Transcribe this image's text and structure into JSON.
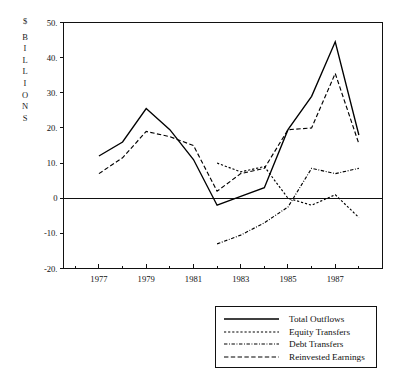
{
  "chart_data": {
    "type": "line",
    "title": "",
    "subtitle": "",
    "xlabel": "",
    "ylabel": "$ BILLIONS",
    "ylabel_chars": [
      "$",
      "B",
      "I",
      "L",
      "L",
      "I",
      "O",
      "N",
      "S"
    ],
    "xlim": [
      1975.5,
      1989.0
    ],
    "ylim": [
      -20,
      50
    ],
    "grid": false,
    "legend_position": "below-right",
    "y_ticks": [
      {
        "value": 50,
        "label": "50."
      },
      {
        "value": 40,
        "label": "40."
      },
      {
        "value": 30,
        "label": "30."
      },
      {
        "value": 20,
        "label": "20."
      },
      {
        "value": 10,
        "label": "10."
      },
      {
        "value": 0,
        "label": "0"
      },
      {
        "value": -10,
        "label": "-10."
      },
      {
        "value": -20,
        "label": "-20."
      }
    ],
    "x_ticks_major": [
      {
        "value": 1977,
        "label": "1977"
      },
      {
        "value": 1979,
        "label": "1979"
      },
      {
        "value": 1981,
        "label": "1981"
      },
      {
        "value": 1983,
        "label": "1983"
      },
      {
        "value": 1985,
        "label": "1985"
      },
      {
        "value": 1987,
        "label": "1987"
      }
    ],
    "x_ticks_minor": [
      1976,
      1978,
      1980,
      1982,
      1984,
      1986,
      1988
    ],
    "series": [
      {
        "name": "Total Outflows",
        "style": "solid",
        "x": [
          1977,
          1978,
          1979,
          1980,
          1981,
          1982,
          1983,
          1984,
          1985,
          1986,
          1987,
          1988
        ],
        "values": [
          12.0,
          16.0,
          25.5,
          19.5,
          11.0,
          -2.0,
          0.5,
          3.0,
          19.5,
          29.0,
          44.5,
          18.0
        ]
      },
      {
        "name": "Equity Transfers",
        "style": "dotted",
        "x": [
          1982,
          1983,
          1984,
          1985,
          1986,
          1987,
          1988
        ],
        "values": [
          10.0,
          7.5,
          9.0,
          0.0,
          -2.0,
          1.0,
          -5.5
        ]
      },
      {
        "name": "Debt Transfers",
        "style": "dashdot",
        "x": [
          1982,
          1983,
          1984,
          1985,
          1986,
          1987,
          1988
        ],
        "values": [
          -13.0,
          -10.5,
          -7.0,
          -2.5,
          8.5,
          7.0,
          8.5
        ]
      },
      {
        "name": "Reinvested Earnings",
        "style": "dashed",
        "x": [
          1977,
          1978,
          1979,
          1980,
          1981,
          1982,
          1983,
          1984,
          1985,
          1986,
          1987,
          1988
        ],
        "values": [
          7.0,
          11.5,
          19.0,
          17.5,
          15.0,
          2.0,
          7.0,
          8.5,
          19.5,
          20.0,
          35.5,
          15.5
        ]
      }
    ],
    "legend": [
      {
        "label": "Total Outflows",
        "style": "solid"
      },
      {
        "label": "Equity Transfers",
        "style": "dotted"
      },
      {
        "label": "Debt Transfers",
        "style": "dashdot"
      },
      {
        "label": "Reinvested Earnings",
        "style": "dashed"
      }
    ],
    "colors": {
      "line": "#000000",
      "axis": "#111111",
      "text": "#101010",
      "background": "#ffffff"
    }
  }
}
